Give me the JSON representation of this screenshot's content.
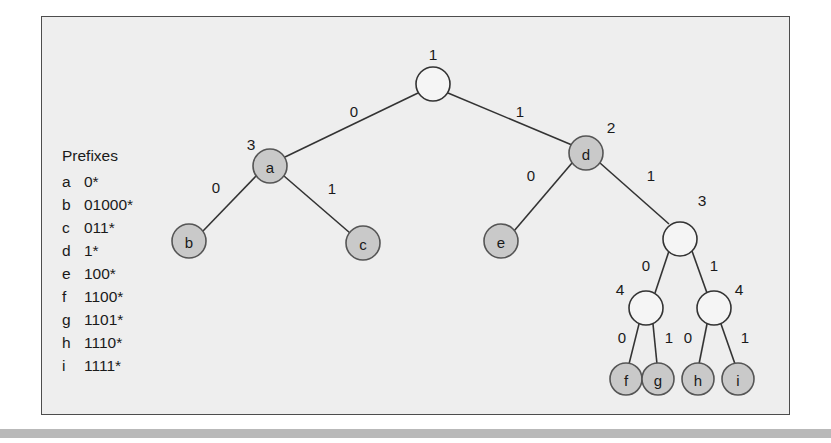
{
  "figure": {
    "background_color": "#eeeeee",
    "border_color": "#4d4d4d",
    "node_fill_color": "#c9c9c9",
    "node_open_color": "#f5f5f5",
    "edge_color": "#333333"
  },
  "legend": {
    "title": "Prefixes",
    "rows": [
      {
        "letter": "a",
        "bits": "0*"
      },
      {
        "letter": "b",
        "bits": "01000*"
      },
      {
        "letter": "c",
        "bits": "011*"
      },
      {
        "letter": "d",
        "bits": "1*"
      },
      {
        "letter": "e",
        "bits": "100*"
      },
      {
        "letter": "f",
        "bits": "1100*"
      },
      {
        "letter": "g",
        "bits": "1101*"
      },
      {
        "letter": "h",
        "bits": "1110*"
      },
      {
        "letter": "i",
        "bits": "1111*"
      }
    ]
  },
  "tree": {
    "nodes": [
      {
        "id": "root",
        "label": "",
        "filled": false,
        "cx": 391,
        "cy": 67,
        "r": 17,
        "level": "1",
        "level_x": 391,
        "level_y": 37
      },
      {
        "id": "a",
        "label": "a",
        "filled": true,
        "cx": 228,
        "cy": 149,
        "r": 17,
        "level": "3",
        "level_x": 209,
        "level_y": 127
      },
      {
        "id": "d",
        "label": "d",
        "filled": true,
        "cx": 544,
        "cy": 136,
        "r": 17,
        "level": "2",
        "level_x": 569,
        "level_y": 110
      },
      {
        "id": "b",
        "label": "b",
        "filled": true,
        "cx": 147,
        "cy": 224,
        "r": 17,
        "level": "",
        "level_x": 0,
        "level_y": 0
      },
      {
        "id": "c",
        "label": "c",
        "filled": true,
        "cx": 321,
        "cy": 226,
        "r": 17,
        "level": "",
        "level_x": 0,
        "level_y": 0
      },
      {
        "id": "e",
        "label": "e",
        "filled": true,
        "cx": 459,
        "cy": 224,
        "r": 17,
        "level": "",
        "level_x": 0,
        "level_y": 0
      },
      {
        "id": "n3",
        "label": "",
        "filled": false,
        "cx": 638,
        "cy": 222,
        "r": 17,
        "level": "3",
        "level_x": 660,
        "level_y": 183
      },
      {
        "id": "n4l",
        "label": "",
        "filled": false,
        "cx": 604,
        "cy": 291,
        "r": 17,
        "level": "4",
        "level_x": 578,
        "level_y": 272
      },
      {
        "id": "n4r",
        "label": "",
        "filled": false,
        "cx": 672,
        "cy": 291,
        "r": 17,
        "level": "4",
        "level_x": 697,
        "level_y": 272
      },
      {
        "id": "f",
        "label": "f",
        "filled": true,
        "cx": 584,
        "cy": 362,
        "r": 16,
        "level": "",
        "level_x": 0,
        "level_y": 0
      },
      {
        "id": "g",
        "label": "g",
        "filled": true,
        "cx": 616,
        "cy": 362,
        "r": 16,
        "level": "",
        "level_x": 0,
        "level_y": 0
      },
      {
        "id": "h",
        "label": "h",
        "filled": true,
        "cx": 656,
        "cy": 362,
        "r": 16,
        "level": "",
        "level_x": 0,
        "level_y": 0
      },
      {
        "id": "i",
        "label": "i",
        "filled": true,
        "cx": 696,
        "cy": 362,
        "r": 16,
        "level": "",
        "level_x": 0,
        "level_y": 0
      }
    ],
    "edges": [
      {
        "from": "root",
        "to": "a",
        "bit": "0",
        "x1": 376,
        "y1": 76,
        "x2": 243,
        "y2": 140,
        "lx": 312,
        "ly": 94
      },
      {
        "from": "root",
        "to": "d",
        "bit": "1",
        "x1": 406,
        "y1": 76,
        "x2": 530,
        "y2": 128,
        "lx": 478,
        "ly": 94
      },
      {
        "from": "a",
        "to": "b",
        "bit": "0",
        "x1": 214,
        "y1": 159,
        "x2": 161,
        "y2": 214,
        "lx": 174,
        "ly": 170
      },
      {
        "from": "a",
        "to": "c",
        "bit": "1",
        "x1": 242,
        "y1": 159,
        "x2": 308,
        "y2": 216,
        "lx": 290,
        "ly": 171
      },
      {
        "from": "d",
        "to": "e",
        "bit": "0",
        "x1": 530,
        "y1": 146,
        "x2": 472,
        "y2": 214,
        "lx": 489,
        "ly": 158
      },
      {
        "from": "d",
        "to": "n3",
        "bit": "1",
        "x1": 558,
        "y1": 146,
        "x2": 627,
        "y2": 207,
        "lx": 609,
        "ly": 158
      },
      {
        "from": "n3",
        "to": "n4l",
        "bit": "0",
        "x1": 627,
        "y1": 234,
        "x2": 613,
        "y2": 276,
        "lx": 604,
        "ly": 248
      },
      {
        "from": "n3",
        "to": "n4r",
        "bit": "1",
        "x1": 650,
        "y1": 234,
        "x2": 665,
        "y2": 276,
        "lx": 672,
        "ly": 248
      },
      {
        "from": "n4l",
        "to": "f",
        "bit": "0",
        "x1": 597,
        "y1": 307,
        "x2": 587,
        "y2": 347,
        "lx": 580,
        "ly": 320
      },
      {
        "from": "n4l",
        "to": "g",
        "bit": "1",
        "x1": 611,
        "y1": 307,
        "x2": 615,
        "y2": 347,
        "lx": 627,
        "ly": 320
      },
      {
        "from": "n4r",
        "to": "h",
        "bit": "0",
        "x1": 665,
        "y1": 307,
        "x2": 657,
        "y2": 347,
        "lx": 646,
        "ly": 320
      },
      {
        "from": "n4r",
        "to": "i",
        "bit": "1",
        "x1": 679,
        "y1": 307,
        "x2": 693,
        "y2": 347,
        "lx": 703,
        "ly": 320
      }
    ]
  },
  "bleed_through": {
    "lines": [
      {
        "text": "the bits of the prefix and the number of bits in the prefix",
        "x": 75,
        "y": 32
      },
      {
        "text": "the trie and the search proceeds down the levels of the trie",
        "x": 75,
        "y": 48
      },
      {
        "text": "are stored in the nodes of the trie structure shown above",
        "x": 75,
        "y": 64
      },
      {
        "text": "longest matching prefix is found at the deepest node",
        "x": 75,
        "y": 264
      }
    ],
    "bar": {
      "top": 428,
      "height": 9
    }
  }
}
